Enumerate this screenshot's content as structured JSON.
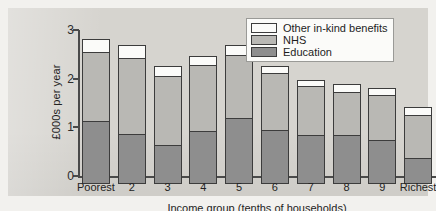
{
  "chart_data": {
    "type": "bar",
    "subtype": "stacked-bar",
    "title": "",
    "xlabel": "Income group (tenths of households)",
    "ylabel": "£000s per year",
    "ylim": [
      0,
      3
    ],
    "yticks": [
      "0",
      "1",
      "2",
      "3"
    ],
    "ytick_values": [
      0,
      1,
      2,
      3
    ],
    "grid": false,
    "legend_position": "top-right",
    "categories": [
      "Poorest",
      "2",
      "3",
      "4",
      "5",
      "6",
      "7",
      "8",
      "9",
      "Richest"
    ],
    "series": [
      {
        "name": "Education",
        "color": "#8e8e8e",
        "values": [
          1.27,
          1.0,
          0.78,
          1.06,
          1.33,
          1.08,
          0.98,
          0.98,
          0.88,
          0.52
        ]
      },
      {
        "name": "NHS",
        "color": "#b9b8b4",
        "values": [
          1.43,
          1.56,
          1.42,
          1.36,
          1.3,
          1.18,
          1.02,
          0.9,
          0.92,
          0.88
        ]
      },
      {
        "name": "Other in-kind benefits",
        "color": "#fbfbf9",
        "values": [
          0.25,
          0.27,
          0.2,
          0.18,
          0.2,
          0.14,
          0.12,
          0.16,
          0.15,
          0.16
        ]
      }
    ],
    "totals": [
      2.95,
      2.83,
      2.4,
      2.6,
      2.83,
      2.4,
      2.12,
      2.04,
      1.95,
      1.56
    ]
  },
  "legend": {
    "items": [
      {
        "label": "Other in-kind benefits",
        "key": "other"
      },
      {
        "label": "NHS",
        "key": "nhs"
      },
      {
        "label": "Education",
        "key": "education"
      }
    ]
  },
  "colors": {
    "education": "#8e8e8e",
    "nhs": "#b9b8b4",
    "other": "#fbfbf9",
    "axis": "#4a4a4a",
    "panel_background": "#d6d4cf",
    "page_background": "#f2f1ee"
  }
}
